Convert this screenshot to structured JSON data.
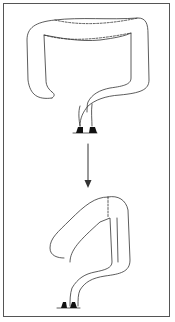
{
  "diagram": {
    "type": "before-after anatomical schematic",
    "panels": [
      {
        "name": "top-tube",
        "description": "large looped tube with dashed fold line, ending in two anchored stubs"
      },
      {
        "name": "bottom-tube",
        "description": "shortened looped tube with dashed fold line, ending in two anchored stubs"
      }
    ],
    "arrow": {
      "direction": "down"
    },
    "colors": {
      "stroke": "#333333",
      "border": "#555555",
      "background": "#ffffff"
    }
  }
}
